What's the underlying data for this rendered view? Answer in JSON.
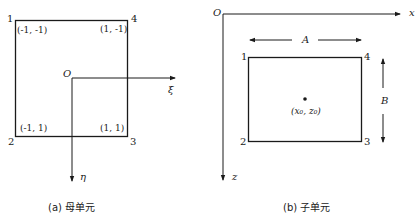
{
  "left_diagram": {
    "caption": "(a) 母单元",
    "nodes": [
      {
        "id": "1",
        "coord": "(-1, -1)"
      },
      {
        "id": "2",
        "coord": "(-1, 1)"
      },
      {
        "id": "3",
        "coord": "(1, 1)"
      },
      {
        "id": "4",
        "coord": "(1, -1)"
      }
    ],
    "origin_label": "O",
    "axis_h_label": "ξ",
    "axis_v_label": "η"
  },
  "right_diagram": {
    "caption": "(b) 子单元",
    "nodes": [
      {
        "id": "1"
      },
      {
        "id": "2"
      },
      {
        "id": "3"
      },
      {
        "id": "4"
      }
    ],
    "origin_label": "O",
    "axis_h_label": "x",
    "axis_v_label": "z",
    "width_label": "A",
    "height_label": "B",
    "center_label": "(x₀, z₀)"
  }
}
